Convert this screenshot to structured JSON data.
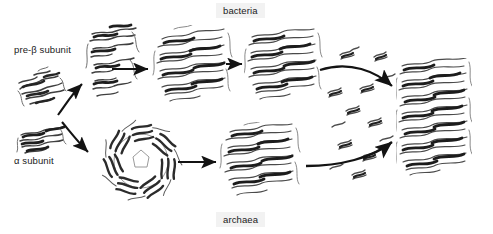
{
  "figure": {
    "title": "",
    "background_color": "#ffffff",
    "width": 493,
    "height": 234
  },
  "labels": {
    "pre_beta_subunit": "pre-β subunit",
    "alpha_subunit": "α subunit",
    "bacteria": "bacteria",
    "archaea": "archaea"
  },
  "colors": {
    "text": "#1a1a1a",
    "label_background": "#f2f2f2",
    "arrow": "#1a1a1a",
    "structure_dark": "#3a3a3a",
    "structure_mid": "#707070",
    "structure_light": "#a8a8a8"
  },
  "structures": [
    {
      "id": "pre-beta-monomer",
      "name": "pre-β subunit monomer",
      "pathway": "bacteria"
    },
    {
      "id": "pre-beta-dimer",
      "name": "pre-β subunit dimer intermediate",
      "pathway": "bacteria"
    },
    {
      "id": "bacteria-half-proteasome",
      "name": "bacterial half-proteasome",
      "pathway": "bacteria"
    },
    {
      "id": "bacteria-preholo",
      "name": "bacterial pre-holoproteasome",
      "pathway": "bacteria"
    },
    {
      "id": "alpha-monomer",
      "name": "α subunit monomer",
      "pathway": "archaea"
    },
    {
      "id": "alpha-ring",
      "name": "α seven-membered ring",
      "pathway": "archaea"
    },
    {
      "id": "archaea-half-proteasome",
      "name": "archaeal half-proteasome",
      "pathway": "archaea"
    },
    {
      "id": "mature-proteasome",
      "name": "mature 20S proteasome",
      "pathway": "shared"
    }
  ],
  "arrows": [
    {
      "id": "arrow-beta-assembly",
      "type": "curved",
      "from": "pre-beta-monomer",
      "to": "pre-beta-dimer"
    },
    {
      "id": "arrow-alpha-assembly",
      "type": "curved",
      "from": "alpha-monomer",
      "to": "alpha-ring"
    },
    {
      "id": "arrow-bacteria-1",
      "type": "straight",
      "from": "pre-beta-dimer",
      "to": "bacteria-half-proteasome"
    },
    {
      "id": "arrow-bacteria-2",
      "type": "straight",
      "from": "bacteria-half-proteasome",
      "to": "bacteria-preholo"
    },
    {
      "id": "arrow-archaea-1",
      "type": "straight",
      "from": "alpha-ring",
      "to": "archaea-half-proteasome"
    },
    {
      "id": "arrow-bacteria-maturation",
      "type": "curved",
      "from": "bacteria-preholo",
      "to": "mature-proteasome"
    },
    {
      "id": "arrow-archaea-maturation",
      "type": "curved",
      "from": "archaea-half-proteasome",
      "to": "mature-proteasome"
    }
  ],
  "propeptide_fragments": {
    "name": "cleaved propeptide fragments",
    "count": 14
  }
}
